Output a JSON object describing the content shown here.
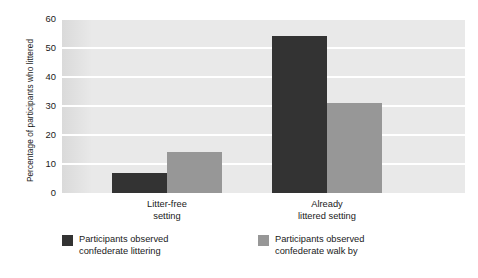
{
  "chart_data": {
    "type": "bar",
    "title": "",
    "xlabel": "",
    "ylabel": "Percentage of participants who littered",
    "categories": [
      "Litter-free\nsetting",
      "Already\nlittered setting"
    ],
    "category_labels_flat": [
      "Litter-free setting",
      "Already littered setting"
    ],
    "series": [
      {
        "name": "Participants observed\nconfederate littering",
        "color": "#333333",
        "values": [
          7,
          54
        ]
      },
      {
        "name": "Participants observed\nconfederate walk by",
        "color": "#979797",
        "values": [
          14,
          31
        ]
      }
    ],
    "ylim": [
      0,
      60
    ],
    "yticks": [
      0,
      10,
      20,
      30,
      40,
      50,
      60
    ],
    "ytick_labels": [
      "0",
      "10",
      "20",
      "30",
      "40",
      "50",
      "60"
    ],
    "grid": "horizontal",
    "grid_color": "#ffffff",
    "plot_background": "#e9e9e9",
    "legend_position": "below"
  },
  "legend": {
    "items": [
      {
        "label": "Participants observed\nconfederate littering",
        "color": "#333333"
      },
      {
        "label": "Participants observed\nconfederate walk by",
        "color": "#979797"
      }
    ]
  }
}
